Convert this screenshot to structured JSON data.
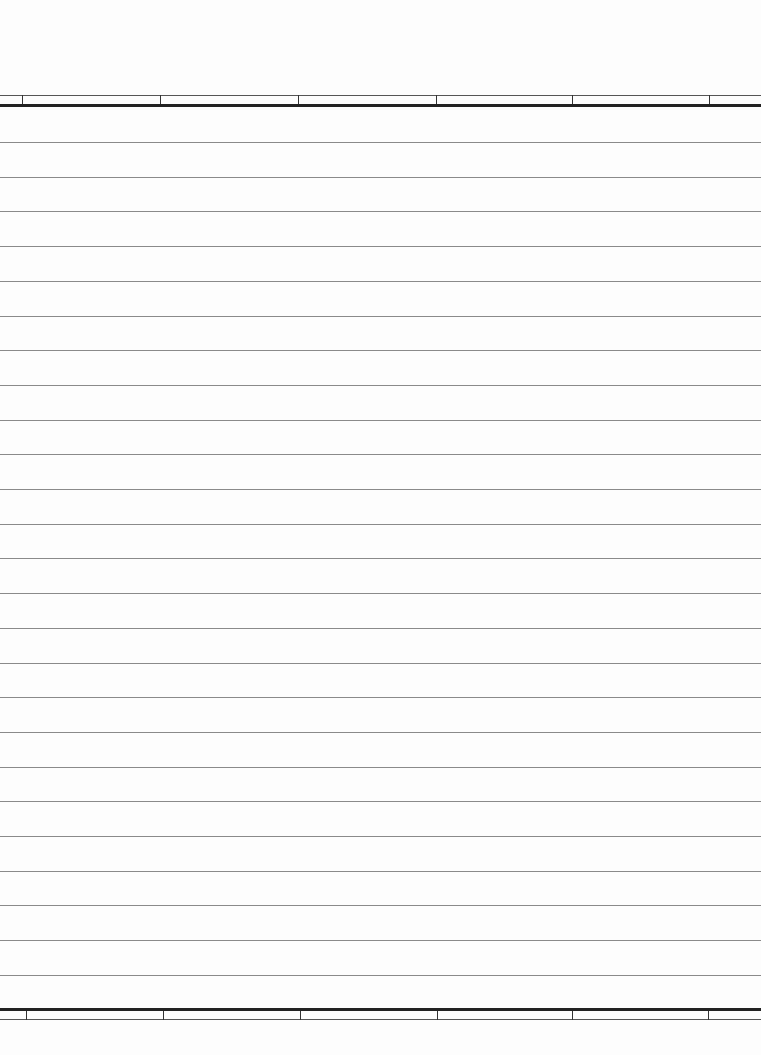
{
  "page": {
    "type": "lined-paper",
    "background": "#fdfdfd",
    "rule_color": "#8a8a8a",
    "border_color": "#222222"
  },
  "header_band": {
    "thin_line_y": 95,
    "thick_line_y": 104,
    "dividers_x": [
      22,
      160,
      298,
      436,
      572,
      709
    ]
  },
  "ruled_lines": {
    "count": 25,
    "first_y": 142,
    "spacing": 34.7
  },
  "footer_band": {
    "thick_line_y": 1008,
    "thin_line_y": 1019,
    "dividers_x": [
      26,
      163,
      300,
      437,
      572,
      708
    ]
  }
}
